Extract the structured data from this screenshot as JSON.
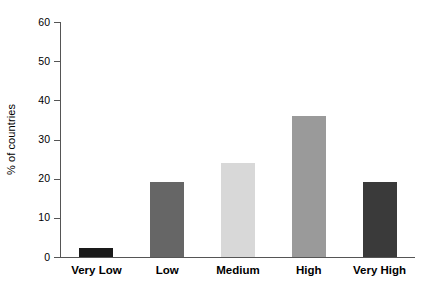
{
  "chart_data": {
    "type": "bar",
    "title": "",
    "subtitle": "",
    "xlabel": "",
    "ylabel": "% of countries",
    "categories": [
      "Very Low",
      "Low",
      "Medium",
      "High",
      "Very High"
    ],
    "values": [
      2.3,
      19.2,
      24.0,
      36.0,
      19.2
    ],
    "series": [
      {
        "name": "% of countries",
        "values": [
          2.3,
          19.2,
          24.0,
          36.0,
          19.2
        ]
      }
    ],
    "ylim": [
      0,
      60
    ],
    "ytick_labels": [
      "0",
      "10",
      "20",
      "30",
      "40",
      "50",
      "60"
    ],
    "ytick_values": [
      0,
      10,
      20,
      30,
      40,
      50,
      60
    ],
    "grid": false,
    "legend": false,
    "legend_position": "none",
    "bar_colors": [
      "#1a1a1a",
      "#666666",
      "#d8d8d8",
      "#9a9a9a",
      "#3a3a3a"
    ],
    "axis_color": "#555555",
    "background": "#ffffff",
    "annotations": []
  }
}
